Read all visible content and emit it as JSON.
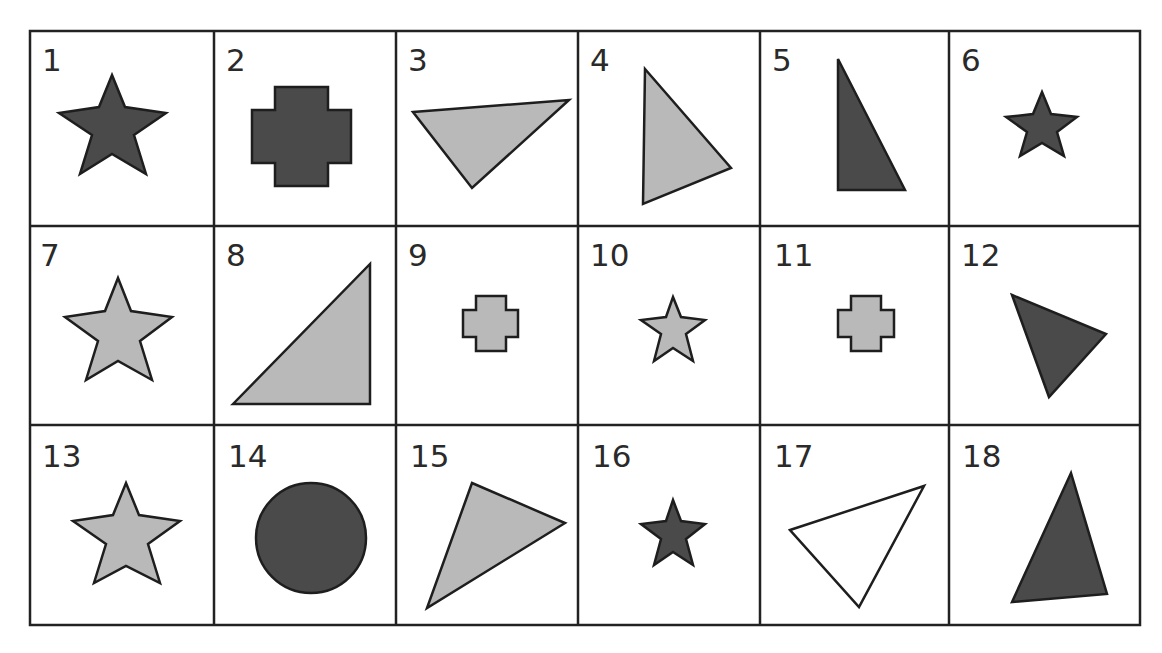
{
  "worksheet": {
    "grid": {
      "rows": 3,
      "columns": 6,
      "x_lines": [
        30,
        214,
        396,
        578,
        760,
        949,
        1140
      ],
      "y_lines": [
        31,
        226,
        425,
        625
      ]
    },
    "colors": {
      "dark": "#4a4a4a",
      "light": "#b9b9b9",
      "white": "#ffffff",
      "outline": "#1e1e1e"
    },
    "cells": [
      {
        "number": "1",
        "shape": "star",
        "fill": "dark",
        "size": "large"
      },
      {
        "number": "2",
        "shape": "cross",
        "fill": "dark",
        "size": "large"
      },
      {
        "number": "3",
        "shape": "triangle",
        "fill": "light",
        "size": "large"
      },
      {
        "number": "4",
        "shape": "triangle",
        "fill": "light",
        "size": "large"
      },
      {
        "number": "5",
        "shape": "triangle",
        "fill": "dark",
        "size": "large"
      },
      {
        "number": "6",
        "shape": "star",
        "fill": "dark",
        "size": "small"
      },
      {
        "number": "7",
        "shape": "star",
        "fill": "light",
        "size": "large"
      },
      {
        "number": "8",
        "shape": "triangle",
        "fill": "light",
        "size": "large"
      },
      {
        "number": "9",
        "shape": "cross",
        "fill": "light",
        "size": "small"
      },
      {
        "number": "10",
        "shape": "star",
        "fill": "light",
        "size": "small"
      },
      {
        "number": "11",
        "shape": "cross",
        "fill": "light",
        "size": "small"
      },
      {
        "number": "12",
        "shape": "triangle",
        "fill": "dark",
        "size": "large"
      },
      {
        "number": "13",
        "shape": "star",
        "fill": "light",
        "size": "large"
      },
      {
        "number": "14",
        "shape": "circle",
        "fill": "dark",
        "size": "large"
      },
      {
        "number": "15",
        "shape": "triangle",
        "fill": "light",
        "size": "large"
      },
      {
        "number": "16",
        "shape": "star",
        "fill": "dark",
        "size": "small"
      },
      {
        "number": "17",
        "shape": "triangle",
        "fill": "white",
        "size": "large"
      },
      {
        "number": "18",
        "shape": "triangle",
        "fill": "dark",
        "size": "large"
      }
    ]
  }
}
